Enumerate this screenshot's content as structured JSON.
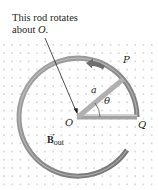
{
  "caption": {
    "line1": "This rod rotates",
    "line2_prefix": "about ",
    "line2_point": "O",
    "line2_suffix": "."
  },
  "labels": {
    "P": "P",
    "Q": "Q",
    "O": "O",
    "a": "a",
    "theta": "θ",
    "B_main": "B",
    "B_sub": "out",
    "B_vector_mark": "→"
  },
  "colors": {
    "rail": "#8c8c8c",
    "rail_highlight": "#bdbdbd",
    "rod": "#a9a9a9",
    "dots": "#b5b5b5",
    "text": "#231f20",
    "rotation_arrow": "#6e6e6e"
  },
  "geometry": {
    "center": [
      78,
      117
    ],
    "radius": 59,
    "theta_deg": 40
  }
}
